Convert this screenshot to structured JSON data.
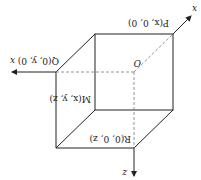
{
  "diagram": {
    "type": "3d-box-coordinates",
    "orientation": "rotated 180 degrees",
    "line_color": "#222222",
    "dashed_color": "#888888",
    "axes": {
      "x_left": "x",
      "x_diag": "x",
      "z": "z"
    },
    "labels": {
      "origin": "O",
      "P": "P(x, 0, 0)",
      "Q": "Q(0, y, 0)",
      "M": "M(x, y, z)",
      "R": "R(0, 0, z)"
    }
  }
}
